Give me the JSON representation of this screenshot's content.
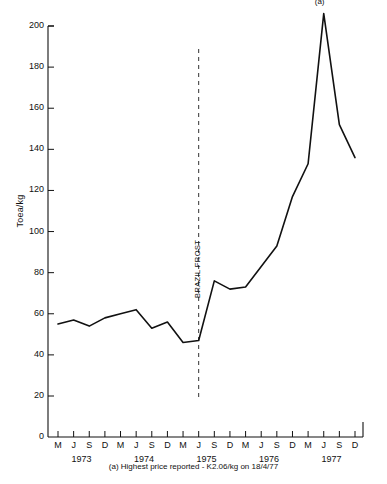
{
  "chart_data": {
    "type": "line",
    "title": "",
    "subtitle": "",
    "xlabel": "",
    "ylabel": "Toea/kg",
    "ylim": [
      0,
      210
    ],
    "yticks": [
      20,
      40,
      60,
      80,
      100,
      120,
      140,
      160,
      180,
      200
    ],
    "ytick_labels": [
      "20",
      "40",
      "60",
      "80",
      "100",
      "120",
      "140",
      "160",
      "180",
      "200"
    ],
    "zero_label": "0",
    "grid": false,
    "legend": "none",
    "x": [
      "M 1973",
      "J 1973",
      "S 1973",
      "D 1973",
      "M 1974",
      "J 1974",
      "S 1974",
      "D 1974",
      "M 1975",
      "J 1975",
      "S 1975",
      "D 1975",
      "M 1976",
      "J 1976",
      "S 1976",
      "D 1976",
      "M 1977",
      "J 1977",
      "S 1977",
      "D 1977"
    ],
    "xtick_labels": [
      "M",
      "J",
      "S",
      "D",
      "M",
      "J",
      "S",
      "D",
      "M",
      "J",
      "S",
      "D",
      "M",
      "J",
      "S",
      "D",
      "M",
      "J",
      "S",
      "D"
    ],
    "year_labels": [
      "1973",
      "1974",
      "1975",
      "1976",
      "1977"
    ],
    "series": [
      {
        "name": "Coffee price",
        "color": "#111111",
        "values": [
          55,
          57,
          54,
          58,
          60,
          62,
          53,
          56,
          46,
          47,
          76,
          72,
          73,
          83,
          93,
          117,
          133,
          206,
          152,
          136
        ]
      }
    ],
    "annotations": [
      {
        "name": "brazil-frost",
        "text": "BRAZIL FROST",
        "x": "J 1975",
        "style": "dashed-vline"
      },
      {
        "name": "peak-marker",
        "text": "(a)",
        "x": "J 1977",
        "y": 206
      }
    ],
    "footnote": {
      "marker": "(a)",
      "text": "Highest price reported - K2.06/kg on 18/4/77"
    }
  }
}
